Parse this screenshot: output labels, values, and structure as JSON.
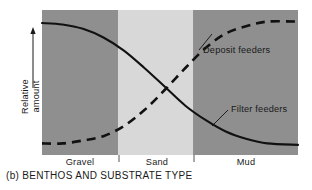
{
  "caption": "(b) BENTHOS AND SUBSTRATE TYPE",
  "axes": {
    "y_label_line1": "Relative",
    "y_label_line2": "amount",
    "y_label": "Relative amount",
    "y_arrow_icon": "up-arrow-icon"
  },
  "series_labels": {
    "deposit": "Deposit feeders",
    "filter": "Filter feeders"
  },
  "colors": {
    "gravel_band": "#8f8f8f",
    "sand_band": "#d8d8d8",
    "mud_band": "#8f8f8f",
    "curve": "#111111",
    "text": "#1a1a1a",
    "background": "#ffffff"
  },
  "chart_data": {
    "type": "line",
    "title": "(b) BENTHOS AND SUBSTRATE TYPE",
    "xlabel": "",
    "ylabel": "Relative amount",
    "grid": false,
    "legend": "inline-annotations",
    "xlim": [
      0,
      100
    ],
    "ylim": [
      0,
      100
    ],
    "x_categories": [
      "Gravel",
      "Sand",
      "Mud"
    ],
    "x_category_bands": [
      {
        "name": "Gravel",
        "x_start": 0,
        "x_end": 29.7,
        "fill": "#8f8f8f"
      },
      {
        "name": "Sand",
        "x_start": 29.7,
        "x_end": 59.0,
        "fill": "#d8d8d8"
      },
      {
        "name": "Mud",
        "x_start": 59.0,
        "x_end": 100,
        "fill": "#8f8f8f"
      }
    ],
    "series": [
      {
        "name": "Filter feeders",
        "style": "solid",
        "x": [
          0,
          8,
          16,
          24,
          32,
          40,
          48,
          56,
          64,
          72,
          80,
          88,
          100
        ],
        "values": [
          91,
          90,
          87,
          81,
          72,
          60,
          47,
          34,
          24,
          16,
          11,
          8,
          7
        ]
      },
      {
        "name": "Deposit feeders",
        "style": "dashed",
        "x": [
          0,
          8,
          16,
          24,
          32,
          40,
          48,
          56,
          64,
          72,
          80,
          88,
          100
        ],
        "values": [
          8,
          8,
          10,
          13,
          20,
          31,
          45,
          60,
          74,
          84,
          89,
          92,
          92
        ]
      }
    ],
    "annotations": [
      {
        "text": "Deposit feeders",
        "x": 63,
        "y": 78,
        "leader": true
      },
      {
        "text": "Filter feeders",
        "x": 66,
        "y": 32,
        "leader": true
      }
    ]
  }
}
